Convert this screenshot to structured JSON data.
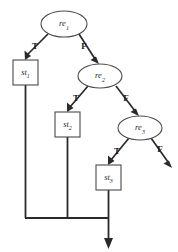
{
  "diagram": {
    "background_color": "#ffffff",
    "node_stroke_color": "#4a4a4a",
    "edge_color": "#2a2a2a",
    "nodes": [
      {
        "id": "re1",
        "shape": "ellipse",
        "base": "re",
        "subscript": "1",
        "label": "re1",
        "cx": 64,
        "cy": 24,
        "rx": 23,
        "ry": 13
      },
      {
        "id": "re2",
        "shape": "ellipse",
        "base": "re",
        "subscript": "2",
        "label": "re2",
        "cx": 100,
        "cy": 76,
        "rx": 22,
        "ry": 12
      },
      {
        "id": "re3",
        "shape": "ellipse",
        "base": "re",
        "subscript": "3",
        "label": "re3",
        "cx": 140,
        "cy": 128,
        "rx": 22,
        "ry": 12
      },
      {
        "id": "st1",
        "shape": "rect",
        "base": "st",
        "subscript": "1",
        "label": "st1",
        "x": 13,
        "y": 60,
        "w": 25,
        "h": 25
      },
      {
        "id": "st2",
        "shape": "rect",
        "base": "st",
        "subscript": "2",
        "label": "st2",
        "x": 55,
        "y": 112,
        "w": 25,
        "h": 25
      },
      {
        "id": "st3",
        "shape": "rect",
        "base": "st",
        "subscript": "3",
        "label": "st3",
        "x": 96,
        "y": 165,
        "w": 25,
        "h": 25
      }
    ],
    "edges": [
      {
        "id": "e-re1-st1",
        "from": "re1",
        "to": "st1",
        "label": "T",
        "label_x": 35,
        "label_y": 47
      },
      {
        "id": "e-re1-re2",
        "from": "re1",
        "to": "re2",
        "label": "F",
        "label_x": 84,
        "label_y": 47
      },
      {
        "id": "e-re2-st2",
        "from": "re2",
        "to": "st2",
        "label": "T",
        "label_x": 76,
        "label_y": 99
      },
      {
        "id": "e-re2-re3",
        "from": "re2",
        "to": "re3",
        "label": "F",
        "label_x": 126,
        "label_y": 99
      },
      {
        "id": "e-re3-st3",
        "from": "re3",
        "to": "st3",
        "label": "T",
        "label_x": 117,
        "label_y": 152
      },
      {
        "id": "e-re3-exit",
        "from": "re3",
        "to": "exit",
        "label": "F",
        "label_x": 160,
        "label_y": 150
      }
    ],
    "merge": {
      "bar_y": 218,
      "bar_x_start": 25,
      "bar_x_end": 108,
      "exit_arrow_x": 108,
      "exit_arrow_y_end": 248
    }
  }
}
